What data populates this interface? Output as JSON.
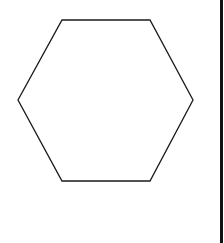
{
  "diagram": {
    "background": "#ffffff",
    "shape": {
      "type": "hexagon",
      "stroke": "#1a1a1a",
      "stroke_width": 1.3,
      "fill": "none",
      "points": "62,20 150,20 193,100 150,181 62,181 18,100"
    },
    "border": {
      "side": "right",
      "color": "#111111"
    }
  }
}
